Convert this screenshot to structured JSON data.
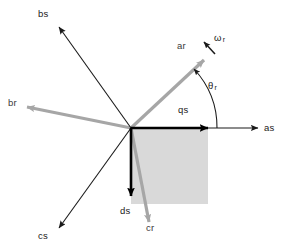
{
  "figure": {
    "type": "vector-axis-diagram",
    "origin": {
      "x": 131,
      "y": 128
    },
    "colors": {
      "stator_axis": "#1a1a1a",
      "rotor_axis": "#a6a6a6",
      "frame_axis": "#000000",
      "shaded_region": "#d9d9d9",
      "background": "#ffffff"
    },
    "shaded_region": {
      "x": 131,
      "y": 128,
      "width": 77,
      "height": 76,
      "fill": "#d9d9d9"
    },
    "axes": [
      {
        "name": "as",
        "label": "as",
        "style": "stator",
        "color": "#1a1a1a",
        "from": [
          131,
          128
        ],
        "to": [
          258,
          128
        ],
        "label_pos": [
          264,
          123
        ],
        "angle_deg": 0
      },
      {
        "name": "bs",
        "label": "bs",
        "style": "stator",
        "color": "#1a1a1a",
        "from": [
          131,
          128
        ],
        "to": [
          59,
          27
        ],
        "label_pos": [
          38,
          9
        ],
        "angle_deg": 125
      },
      {
        "name": "cs",
        "label": "cs",
        "style": "stator",
        "color": "#1a1a1a",
        "from": [
          131,
          128
        ],
        "to": [
          59,
          228
        ],
        "label_pos": [
          38,
          231
        ],
        "angle_deg": -125
      },
      {
        "name": "ar",
        "label": "ar",
        "style": "rotor",
        "color": "#a6a6a6",
        "from": [
          131,
          128
        ],
        "to": [
          204,
          60
        ],
        "label_pos": [
          177,
          41
        ],
        "angle_deg": 43
      },
      {
        "name": "br",
        "label": "br",
        "style": "rotor",
        "color": "#a6a6a6",
        "from": [
          131,
          128
        ],
        "to": [
          27,
          107
        ],
        "label_pos": [
          8,
          97
        ],
        "angle_deg": 168
      },
      {
        "name": "cr",
        "label": "cr",
        "style": "rotor",
        "color": "#a6a6a6",
        "from": [
          131,
          128
        ],
        "to": [
          149,
          222
        ],
        "label_pos": [
          145,
          224
        ],
        "angle_deg": -79
      },
      {
        "name": "qs",
        "label": "qs",
        "style": "frame",
        "color": "#000000",
        "from": [
          131,
          128
        ],
        "to": [
          210,
          128
        ],
        "label_pos": [
          178,
          105
        ],
        "angle_deg": 0
      },
      {
        "name": "ds",
        "label": "ds",
        "style": "frame",
        "color": "#000000",
        "from": [
          131,
          128
        ],
        "to": [
          131,
          197
        ],
        "label_pos": [
          120,
          206
        ],
        "angle_deg": -90
      }
    ],
    "annotations": [
      {
        "name": "theta-r",
        "symbol": "θ",
        "subscript": "r",
        "pos": [
          208,
          81
        ],
        "meaning": "rotor position angle between qs and ar axes",
        "arc": {
          "center": [
            131,
            128
          ],
          "radius": 86,
          "start_deg": 0,
          "end_deg": 43
        }
      },
      {
        "name": "omega-r",
        "symbol": "ω",
        "subscript": "r",
        "pos": [
          214,
          33
        ],
        "meaning": "rotor angular speed",
        "arrow": {
          "from": [
            214,
            53
          ],
          "to": [
            203,
            41
          ]
        }
      }
    ],
    "labels": {
      "as": "as",
      "bs": "bs",
      "cs": "cs",
      "ar": "ar",
      "br": "br",
      "cr": "cr",
      "qs": "qs",
      "ds": "ds",
      "theta": "θ",
      "theta_sub": "r",
      "omega": "ω",
      "omega_sub": "r"
    }
  }
}
